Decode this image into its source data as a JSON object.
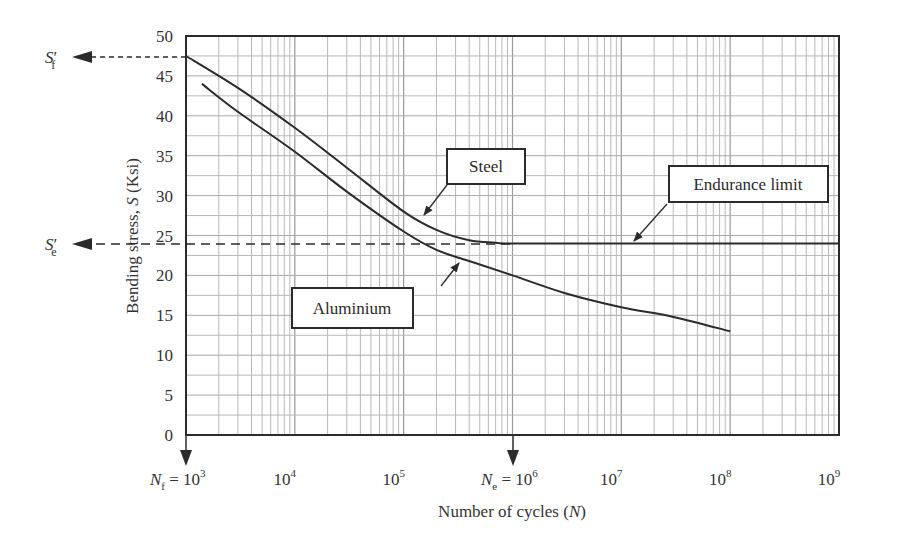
{
  "chart_data": {
    "type": "line",
    "title": "",
    "xlabel": "Number of cycles (N)",
    "ylabel": "Bending stress, S (Ksi)",
    "xscale": "log",
    "xlim": [
      1000,
      1000000000
    ],
    "ylim": [
      0,
      50
    ],
    "grid": true,
    "x_tick_labels": [
      "N_f = 10^3",
      "10^4",
      "10^5",
      "N_e = 10^6",
      "10^7",
      "10^8",
      "10^9"
    ],
    "y_tick_labels": [
      "0",
      "5",
      "10",
      "15",
      "20",
      "25",
      "30",
      "35",
      "40",
      "45",
      "50"
    ],
    "series": [
      {
        "name": "Steel",
        "x": [
          1000,
          3000,
          10000,
          30000,
          100000,
          200000,
          400000,
          700000,
          1000000,
          10000000,
          100000000,
          1000000000
        ],
        "y": [
          47.5,
          43.5,
          38.5,
          33.5,
          28.0,
          25.7,
          24.4,
          24.1,
          24.0,
          24.0,
          24.0,
          24.0
        ]
      },
      {
        "name": "Aluminium",
        "x": [
          1400,
          3000,
          10000,
          30000,
          100000,
          200000,
          400000,
          1000000,
          3000000,
          10000000,
          30000000,
          100000000
        ],
        "y": [
          44.0,
          40.5,
          35.5,
          30.5,
          25.5,
          23.2,
          21.8,
          20.0,
          17.8,
          16.0,
          14.8,
          13.0
        ]
      }
    ],
    "annotations": [
      {
        "text": "Steel",
        "type": "callout-box"
      },
      {
        "text": "Aluminium",
        "type": "callout-box"
      },
      {
        "text": "Endurance limit",
        "type": "callout-box",
        "y": 24
      },
      {
        "text": "S'_f",
        "type": "dashed-arrow",
        "y": 47.5
      },
      {
        "text": "S'_e",
        "type": "dashed-arrow",
        "y": 24
      },
      {
        "text": "N_f = 10^3",
        "type": "down-arrow",
        "x": 1000
      },
      {
        "text": "N_e = 10^6",
        "type": "down-arrow",
        "x": 1000000
      }
    ]
  },
  "labels": {
    "steel": "Steel",
    "aluminium": "Aluminium",
    "endurance": "Endurance limit",
    "sf_main": "S",
    "sf_sub": "f",
    "se_main": "S",
    "se_sub": "e",
    "prime": "′",
    "nf_main": "N",
    "nf_sub": "f",
    "nf_eq": " = 10",
    "nf_exp": "3",
    "ne_main": "N",
    "ne_sub": "e",
    "ne_eq": " = 10",
    "ne_exp": "6",
    "xlabel_pre": "Number of cycles (",
    "xlabel_var": "N",
    "xlabel_post": ")",
    "ylabel_pre": "Bending stress, ",
    "ylabel_var": "S",
    "ylabel_post": " (Ksi)",
    "x_ticks": [
      {
        "base": "10",
        "exp": "4"
      },
      {
        "base": "10",
        "exp": "5"
      },
      {
        "base": "10",
        "exp": "7"
      },
      {
        "base": "10",
        "exp": "8"
      },
      {
        "base": "10",
        "exp": "9"
      }
    ],
    "y_ticks": [
      "0",
      "5",
      "10",
      "15",
      "20",
      "25",
      "30",
      "35",
      "40",
      "45",
      "50"
    ]
  },
  "colors": {
    "line": "#2b2b2b",
    "grid": "#b8b8b8",
    "axis": "#2b2b2b"
  }
}
